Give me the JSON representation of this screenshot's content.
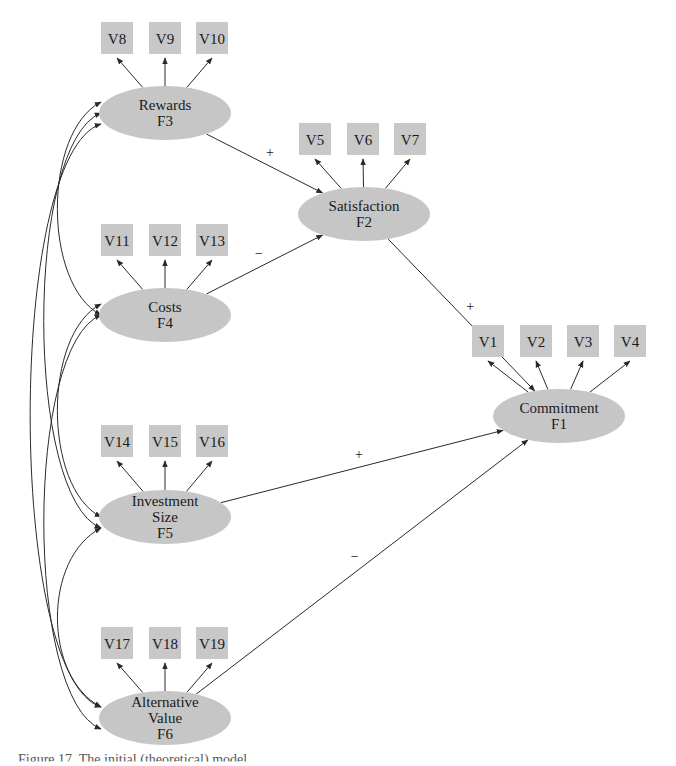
{
  "factors": [
    {
      "id": "F3",
      "name": "Rewards",
      "lines": [
        "Rewards",
        "F3"
      ],
      "cx": 165,
      "cy": 113,
      "rx": 66,
      "ry": 27
    },
    {
      "id": "F2",
      "name": "Satisfaction",
      "lines": [
        "Satisfaction",
        "F2"
      ],
      "cx": 364,
      "cy": 214,
      "rx": 66,
      "ry": 27
    },
    {
      "id": "F4",
      "name": "Costs",
      "lines": [
        "Costs",
        "F4"
      ],
      "cx": 165,
      "cy": 315,
      "rx": 66,
      "ry": 27
    },
    {
      "id": "F1",
      "name": "Commitment",
      "lines": [
        "Commitment",
        "F1"
      ],
      "cx": 559,
      "cy": 416,
      "rx": 66,
      "ry": 27
    },
    {
      "id": "F5",
      "name": "Investment Size",
      "lines": [
        "Investment",
        "Size",
        "F5"
      ],
      "cx": 165,
      "cy": 517,
      "rx": 66,
      "ry": 27
    },
    {
      "id": "F6",
      "name": "Alternative Value",
      "lines": [
        "Alternative",
        "Value",
        "F6"
      ],
      "cx": 165,
      "cy": 718,
      "rx": 66,
      "ry": 27
    }
  ],
  "indicators": [
    {
      "label": "V8",
      "factor": "F3",
      "x": 101,
      "y": 22
    },
    {
      "label": "V9",
      "factor": "F3",
      "x": 149,
      "y": 22
    },
    {
      "label": "V10",
      "factor": "F3",
      "x": 196,
      "y": 22
    },
    {
      "label": "V5",
      "factor": "F2",
      "x": 299,
      "y": 123
    },
    {
      "label": "V6",
      "factor": "F2",
      "x": 347,
      "y": 123
    },
    {
      "label": "V7",
      "factor": "F2",
      "x": 394,
      "y": 123
    },
    {
      "label": "V11",
      "factor": "F4",
      "x": 101,
      "y": 224
    },
    {
      "label": "V12",
      "factor": "F4",
      "x": 149,
      "y": 224
    },
    {
      "label": "V13",
      "factor": "F4",
      "x": 196,
      "y": 224
    },
    {
      "label": "V1",
      "factor": "F1",
      "x": 472,
      "y": 325
    },
    {
      "label": "V2",
      "factor": "F1",
      "x": 520,
      "y": 325
    },
    {
      "label": "V3",
      "factor": "F1",
      "x": 567,
      "y": 325
    },
    {
      "label": "V4",
      "factor": "F1",
      "x": 614,
      "y": 325
    },
    {
      "label": "V14",
      "factor": "F5",
      "x": 101,
      "y": 425
    },
    {
      "label": "V15",
      "factor": "F5",
      "x": 149,
      "y": 425
    },
    {
      "label": "V16",
      "factor": "F5",
      "x": 196,
      "y": 425
    },
    {
      "label": "V17",
      "factor": "F6",
      "x": 101,
      "y": 627
    },
    {
      "label": "V18",
      "factor": "F6",
      "x": 149,
      "y": 627
    },
    {
      "label": "V19",
      "factor": "F6",
      "x": 196,
      "y": 627
    }
  ],
  "structural_paths": [
    {
      "from": "F3",
      "to": "F2",
      "sign": "+"
    },
    {
      "from": "F4",
      "to": "F2",
      "sign": "−"
    },
    {
      "from": "F2",
      "to": "F1",
      "sign": "+"
    },
    {
      "from": "F5",
      "to": "F1",
      "sign": "+"
    },
    {
      "from": "F6",
      "to": "F1",
      "sign": "−"
    }
  ],
  "covariances": [
    [
      "F3",
      "F4"
    ],
    [
      "F3",
      "F5"
    ],
    [
      "F3",
      "F6"
    ],
    [
      "F4",
      "F5"
    ],
    [
      "F4",
      "F6"
    ],
    [
      "F5",
      "F6"
    ]
  ],
  "colors": {
    "node_fill": "#c6c6c6",
    "line": "#2a2a2a",
    "background": "#ffffff"
  },
  "caption": {
    "text": "Figure 17.  The initial (theoretical) model"
  }
}
